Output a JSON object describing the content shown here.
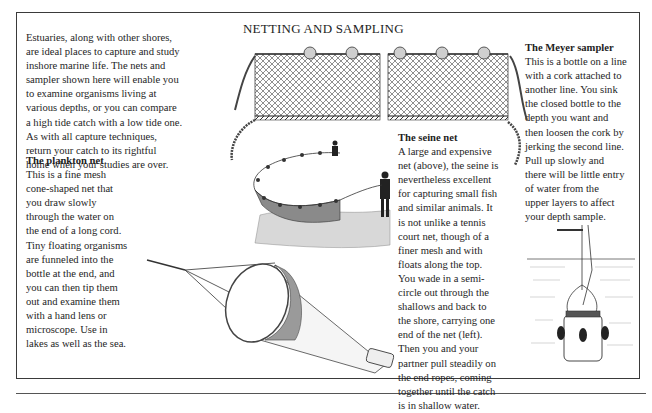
{
  "page": {
    "title": "NETTING AND SAMPLING"
  },
  "intro": {
    "lines": [
      "Estuaries, along with other shores,",
      "are ideal places to capture and study",
      "inshore marine life. The nets and",
      "sampler shown here will enable you",
      "to examine organisms living at",
      "various depths, or you can compare",
      "a high tide catch with a low tide one.",
      "As with all capture techniques,",
      "return your catch to its rightful",
      "home when your studies are over."
    ]
  },
  "plankton_net": {
    "heading": "The plankton net",
    "lines": [
      "This is a fine mesh",
      "cone-shaped net that",
      "you draw slowly",
      "through the water on",
      "the end of a long cord.",
      "Tiny floating organisms",
      "are funneled into the",
      "bottle at the end, and",
      "you can then tip them",
      "out and examine them",
      "with a hand lens or",
      "microscope. Use in",
      "lakes as well as the sea."
    ]
  },
  "seine_net": {
    "heading": "The seine net",
    "lines": [
      "A large and expensive",
      "net (above), the seine is",
      "nevertheless excellent",
      "for capturing small fish",
      "and similar animals. It",
      "is not unlike a tennis",
      "court net, though of a",
      "finer mesh and with",
      "floats along the top.",
      "You wade in a semi-",
      "circle out through the",
      "shallows and back to",
      "the shore, carrying one",
      "end of the net (left).",
      "Then you and your",
      "partner pull steadily on",
      "the end ropes, coming",
      "together until the catch",
      "is in shallow water."
    ]
  },
  "meyer_sampler": {
    "heading": "The Meyer sampler",
    "lines": [
      "This is a bottle on a line",
      "with a cork attached to",
      "another line. You sink",
      "the closed bottle to the",
      "depth you want and",
      "then loosen the cork by",
      "jerking the second line.",
      "Pull up slowly and",
      "there will be little entry",
      "of water from the",
      "upper layers to affect",
      "your depth sample."
    ]
  },
  "illustrations": {
    "seine_net_panel": "seine-net-illustration",
    "seine_net_in_use": "seine-net-fishing-illustration",
    "plankton_net": "plankton-net-illustration",
    "meyer_sampler": "meyer-sampler-illustration"
  },
  "colors": {
    "ink": "#1e1e1e",
    "frame": "#3a3a3a",
    "paper": "#ffffff",
    "float": "#cfcfcf",
    "shade": "#8a8a8a"
  }
}
